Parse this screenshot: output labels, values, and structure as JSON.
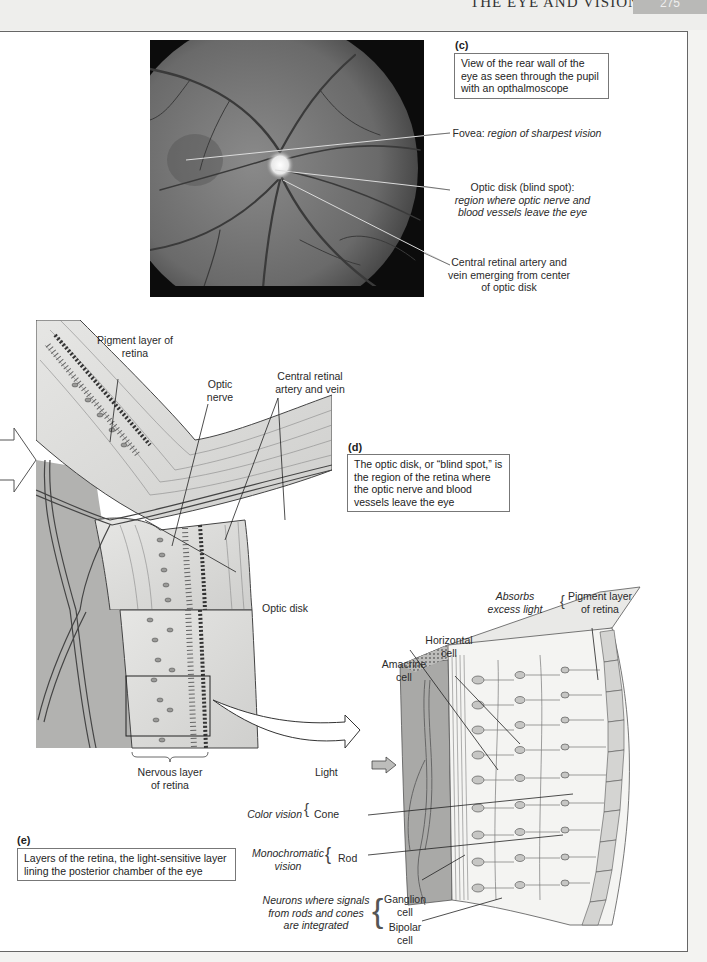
{
  "header": {
    "running_title": "THE EYE AND VISION",
    "page_tab": "275"
  },
  "panel_c": {
    "letter": "(c)",
    "caption": "View of the rear wall of the eye as seen through the pupil with an opthalmoscope",
    "image": "fundus-photograph",
    "labels": {
      "fovea_title": "Fovea: ",
      "fovea_desc": "region of sharpest vision",
      "optic_disk_title": "Optic disk (blind spot):",
      "optic_disk_desc": "region where optic nerve and blood vessels leave the eye",
      "artery_vein": "Central retinal artery and vein emerging from center of optic disk"
    }
  },
  "panel_d": {
    "letter": "(d)",
    "caption": "The optic disk, or “blind spot,” is the region of the retina where the optic nerve and blood vessels leave the eye",
    "labels": {
      "pigment_layer": "Pigment layer of retina",
      "optic_nerve": "Optic nerve",
      "central_artery_vein": "Central retinal artery and vein",
      "optic_disk": "Optic disk",
      "nervous_layer": "Nervous layer of retina"
    }
  },
  "panel_e": {
    "letter": "(e)",
    "caption": "Layers of the retina, the light-sensitive layer lining the posterior chamber of the eye",
    "labels": {
      "absorbs_excess_light": "Absorbs excess light",
      "pigment_layer": "Pigment layer of retina",
      "horizontal_cell": "Horizontal cell",
      "amacrine_cell": "Amacrine cell",
      "light": "Light",
      "color_vision": "Color vision",
      "cone": "Cone",
      "monochromatic_vision": "Monochromatic vision",
      "rod": "Rod",
      "neurons_integrated": "Neurons where signals from rods and cones are integrated",
      "ganglion_cell": "Ganglion cell",
      "bipolar_cell": "Bipolar cell"
    }
  },
  "colors": {
    "page": "#ffffff",
    "band": "#eeeeec",
    "tab": "#b9b9b7",
    "line": "#333333",
    "fundus_dark": "#111111",
    "fundus_mid": "#6b6b6b",
    "tissue": "#d8d8d6",
    "vitreous": "#a9a9a7"
  }
}
